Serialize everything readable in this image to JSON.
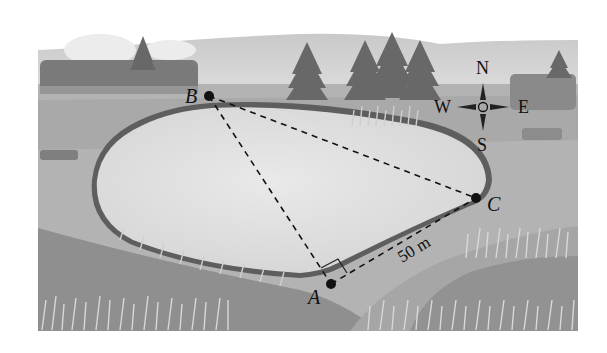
{
  "figure": {
    "points": {
      "A": {
        "label": "A"
      },
      "B": {
        "label": "B"
      },
      "C": {
        "label": "C"
      }
    },
    "distance_label": "50 m",
    "compass": {
      "north": "N",
      "south": "S",
      "east": "E",
      "west": "W"
    },
    "colors": {
      "sky": "#d9d9d9",
      "ground_light": "#b4b4b4",
      "ground_mid": "#a2a2a2",
      "ground_dark": "#8e8e8e",
      "water": "#dedede",
      "shore": "#5a5a5a",
      "trees": "#6b6b6b",
      "ink": "#111111"
    }
  }
}
